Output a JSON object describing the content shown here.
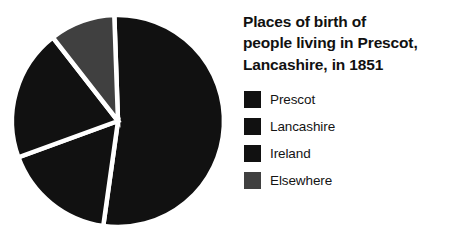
{
  "chart_data": {
    "type": "pie",
    "title": "Places of birth of\npeople living in Prescot,\nLancashire, in 1851",
    "xlabel": "",
    "ylabel": "",
    "legend_position": "right",
    "grid": false,
    "categories": [
      "Prescot",
      "Lancashire",
      "Ireland",
      "Elsewhere"
    ],
    "values": [
      53,
      20,
      17,
      10
    ],
    "colors": [
      "#111111",
      "#111111",
      "#111111",
      "#404040"
    ],
    "slices": [
      {
        "label": "Prescot",
        "value": 53,
        "color": "#111111",
        "start_angle": -2,
        "end_angle": 188
      },
      {
        "label": "Ireland",
        "value": 17,
        "color": "#111111",
        "start_angle": 188,
        "end_angle": 250
      },
      {
        "label": "Lancashire",
        "value": 20,
        "color": "#111111",
        "start_angle": 250,
        "end_angle": 322
      },
      {
        "label": "Elsewhere",
        "value": 10,
        "color": "#404040",
        "start_angle": 322,
        "end_angle": 358
      }
    ],
    "separator_color": "#ffffff",
    "background": "#ffffff"
  },
  "figure": {
    "title_text": "Places of birth of\npeople living in Prescot,\nLancashire, in 1851"
  },
  "legend": {
    "items": [
      {
        "label": "Prescot",
        "color": "#111111"
      },
      {
        "label": "Lancashire",
        "color": "#111111"
      },
      {
        "label": "Ireland",
        "color": "#111111"
      },
      {
        "label": "Elsewhere",
        "color": "#404040"
      }
    ]
  }
}
